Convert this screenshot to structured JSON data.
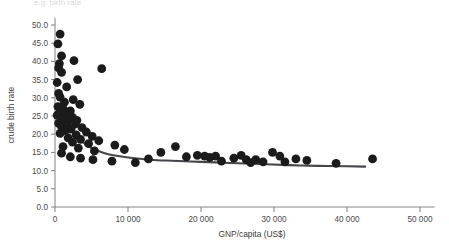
{
  "figure": {
    "background_color": "#ffffff",
    "width": 449,
    "height": 245,
    "cropped_caption_fragment": "e.g. birth rate"
  },
  "chart_data": {
    "type": "scatter",
    "title": "",
    "xlabel": "GNP/capita (US$)",
    "ylabel": "crude birth rate",
    "xlim": [
      0,
      52000
    ],
    "ylim": [
      0,
      52
    ],
    "xticks": [
      0,
      10000,
      20000,
      30000,
      40000,
      50000
    ],
    "xtick_labels": [
      "0",
      "10 000",
      "20 000",
      "30 000",
      "40 000",
      "50 000"
    ],
    "yticks": [
      0,
      5,
      10,
      15,
      20,
      25,
      30,
      35,
      40,
      45,
      50
    ],
    "ytick_labels": [
      "0.0",
      "5.0",
      "10.0",
      "15.0",
      "20.0",
      "25.0",
      "30.0",
      "35.0",
      "40.0",
      "45.0",
      "50.0"
    ],
    "grid": false,
    "legend": null,
    "marker_color": "#1b1b1b",
    "marker_size": 4.4,
    "trend_color": "#46464a",
    "series": [
      {
        "name": "countries",
        "points": [
          [
            700,
            47.5
          ],
          [
            400,
            44.8
          ],
          [
            900,
            41.5
          ],
          [
            2600,
            40.2
          ],
          [
            600,
            39.4
          ],
          [
            500,
            38.2
          ],
          [
            6400,
            38.0
          ],
          [
            900,
            37.0
          ],
          [
            3100,
            35.0
          ],
          [
            300,
            34.2
          ],
          [
            1600,
            33.0
          ],
          [
            500,
            31.2
          ],
          [
            700,
            30.2
          ],
          [
            2500,
            29.5
          ],
          [
            1300,
            28.8
          ],
          [
            3400,
            28.2
          ],
          [
            400,
            27.6
          ],
          [
            1100,
            27.0
          ],
          [
            2100,
            26.4
          ],
          [
            600,
            25.8
          ],
          [
            300,
            25.2
          ],
          [
            1500,
            25.0
          ],
          [
            2400,
            24.6
          ],
          [
            800,
            24.2
          ],
          [
            1900,
            24.0
          ],
          [
            3000,
            23.8
          ],
          [
            1200,
            23.4
          ],
          [
            500,
            23.0
          ],
          [
            2800,
            22.8
          ],
          [
            1700,
            22.4
          ],
          [
            900,
            22.0
          ],
          [
            3700,
            21.8
          ],
          [
            2200,
            21.4
          ],
          [
            1400,
            21.0
          ],
          [
            4300,
            20.6
          ],
          [
            700,
            20.2
          ],
          [
            2900,
            19.8
          ],
          [
            5100,
            19.4
          ],
          [
            1800,
            19.0
          ],
          [
            3500,
            18.6
          ],
          [
            6000,
            18.2
          ],
          [
            2400,
            17.8
          ],
          [
            4600,
            17.4
          ],
          [
            8200,
            17.0
          ],
          [
            1100,
            16.6
          ],
          [
            3200,
            16.2
          ],
          [
            9500,
            15.8
          ],
          [
            5400,
            15.4
          ],
          [
            900,
            14.8
          ],
          [
            2100,
            13.8
          ],
          [
            3500,
            13.4
          ],
          [
            5200,
            13.0
          ],
          [
            7800,
            12.6
          ],
          [
            11000,
            12.2
          ],
          [
            14500,
            15.0
          ],
          [
            12800,
            13.2
          ],
          [
            16500,
            16.6
          ],
          [
            18000,
            13.8
          ],
          [
            19500,
            14.2
          ],
          [
            20500,
            14.0
          ],
          [
            21200,
            13.6
          ],
          [
            22000,
            14.0
          ],
          [
            22800,
            12.6
          ],
          [
            24500,
            13.4
          ],
          [
            25500,
            14.2
          ],
          [
            26200,
            13.0
          ],
          [
            26800,
            12.2
          ],
          [
            27500,
            13.0
          ],
          [
            28500,
            12.4
          ],
          [
            29800,
            15.0
          ],
          [
            30800,
            14.0
          ],
          [
            31500,
            12.4
          ],
          [
            33000,
            13.2
          ],
          [
            34500,
            12.8
          ],
          [
            38500,
            12.0
          ],
          [
            43500,
            13.2
          ]
        ]
      }
    ],
    "trend": {
      "name": "fitted curve",
      "points": [
        [
          250,
          28.2
        ],
        [
          700,
          26.4
        ],
        [
          1200,
          24.6
        ],
        [
          1800,
          22.6
        ],
        [
          2500,
          20.6
        ],
        [
          3300,
          18.8
        ],
        [
          4200,
          17.2
        ],
        [
          5200,
          16.0
        ],
        [
          6500,
          15.0
        ],
        [
          8000,
          14.2
        ],
        [
          10000,
          13.6
        ],
        [
          13000,
          13.0
        ],
        [
          16000,
          12.7
        ],
        [
          20000,
          12.4
        ],
        [
          24000,
          12.1
        ],
        [
          28000,
          11.8
        ],
        [
          32000,
          11.5
        ],
        [
          36000,
          11.3
        ],
        [
          40000,
          11.2
        ],
        [
          42500,
          11.1
        ]
      ]
    }
  }
}
